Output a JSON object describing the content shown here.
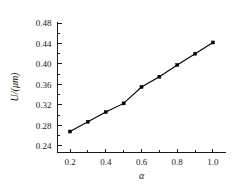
{
  "chart_data": {
    "type": "line",
    "title": "",
    "xlabel": "α",
    "ylabel": "U/(μm)",
    "xlim": [
      0.13,
      1.07
    ],
    "ylim": [
      0.227,
      0.483
    ],
    "xticks": [
      "0.2",
      "0.4",
      "0.6",
      "0.8",
      "1.0"
    ],
    "xtick_values": [
      0.2,
      0.4,
      0.6,
      0.8,
      1.0
    ],
    "yticks": [
      "0.24",
      "0.28",
      "0.32",
      "0.36",
      "0.40",
      "0.44",
      "0.48"
    ],
    "ytick_values": [
      0.24,
      0.28,
      0.32,
      0.36,
      0.4,
      0.44,
      0.48
    ],
    "minor_xticks": [
      0.3,
      0.5,
      0.7,
      0.9
    ],
    "minor_yticks": [
      0.26,
      0.3,
      0.34,
      0.38,
      0.42,
      0.46
    ],
    "grid": false,
    "legend": null,
    "marker": "square",
    "line_color": "#000000",
    "marker_color": "#000000",
    "x": [
      0.2,
      0.3,
      0.4,
      0.5,
      0.6,
      0.7,
      0.8,
      0.9,
      1.0
    ],
    "values": [
      0.268,
      0.287,
      0.306,
      0.323,
      0.355,
      0.375,
      0.398,
      0.42,
      0.442
    ],
    "series": [
      {
        "name": "U",
        "x": [
          0.2,
          0.3,
          0.4,
          0.5,
          0.6,
          0.7,
          0.8,
          0.9,
          1.0
        ],
        "values": [
          0.268,
          0.287,
          0.306,
          0.323,
          0.355,
          0.375,
          0.398,
          0.42,
          0.442
        ]
      }
    ]
  },
  "axes": {
    "y_label_text": "U/(μm)",
    "x_label_text": "α"
  }
}
